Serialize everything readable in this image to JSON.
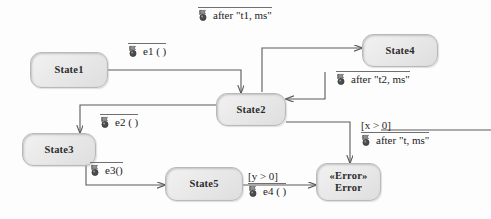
{
  "diagram": {
    "background": "#fdfdfd",
    "node_fill": "#e9e9e9",
    "node_border": "#b9b9b9",
    "edge_color": "#5a5a5a"
  },
  "states": [
    {
      "id": "state1",
      "name": "State1",
      "stereotype": ""
    },
    {
      "id": "state2",
      "name": "State2",
      "stereotype": ""
    },
    {
      "id": "state3",
      "name": "State3",
      "stereotype": ""
    },
    {
      "id": "state4",
      "name": "State4",
      "stereotype": ""
    },
    {
      "id": "state5",
      "name": "State5",
      "stereotype": ""
    },
    {
      "id": "error",
      "name": "Error",
      "stereotype": "«Error»"
    }
  ],
  "transitions": [
    {
      "id": "t_after_t1",
      "from": "state2",
      "to": "state4",
      "guard": "",
      "icon": "event-icon",
      "event": "after \"t1, ms\""
    },
    {
      "id": "t_e1",
      "from": "state1",
      "to": "state2",
      "guard": "",
      "icon": "event-icon",
      "event": "e1 ( )"
    },
    {
      "id": "t_after_t2",
      "from": "state4",
      "to": "state2",
      "guard": "",
      "icon": "event-icon",
      "event": "after \"t2, ms\""
    },
    {
      "id": "t_e2",
      "from": "state2",
      "to": "state3",
      "guard": "",
      "icon": "event-icon",
      "event": "e2 ( )"
    },
    {
      "id": "t_e3",
      "from": "state3",
      "to": "state5",
      "guard": "",
      "icon": "event-icon",
      "event": "e3()"
    },
    {
      "id": "t_e4",
      "from": "state5",
      "to": "error",
      "guard": "[y > 0]",
      "icon": "event-icon",
      "event": "e4 ( )"
    },
    {
      "id": "t_after_t",
      "from": "state2",
      "to": "error",
      "guard": "[x > 0]",
      "icon": "event-icon",
      "event": "after \"t, ms\""
    }
  ]
}
